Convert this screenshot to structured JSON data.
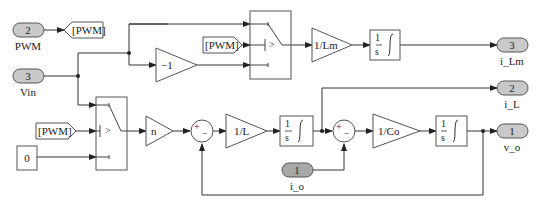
{
  "diagram": {
    "type": "simulink-block-diagram",
    "inports": [
      {
        "number": "2",
        "name": "PWM"
      },
      {
        "number": "3",
        "name": "Vin"
      },
      {
        "number": "1",
        "name": "i_o"
      }
    ],
    "outports": [
      {
        "number": "3",
        "name": "i_Lm"
      },
      {
        "number": "2",
        "name": "i_L"
      },
      {
        "number": "1",
        "name": "v_o"
      }
    ],
    "goto_tag": "[PWM]",
    "from_tags": [
      "[PWM]",
      "[PWM]"
    ],
    "constant": "0",
    "gains": {
      "neg_one": "−1",
      "one_over_lm": "1/Lm",
      "n": "n",
      "one_over_l": "1/L",
      "one_over_co": "1/Co"
    },
    "integrator": {
      "num": "1",
      "den": "s"
    },
    "switch_threshold": ">",
    "sum_signs": {
      "plus": "+",
      "minus": "−"
    }
  }
}
